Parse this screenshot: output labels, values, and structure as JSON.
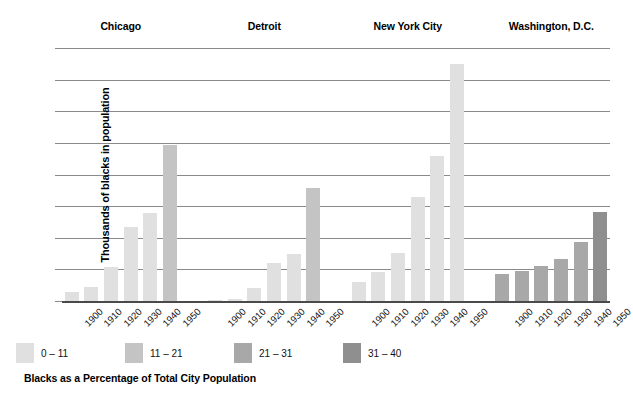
{
  "chart_data": {
    "type": "bar",
    "title": "",
    "xlabel": "",
    "ylabel": "Thousands of blacks in population",
    "ylim": [
      0,
      800
    ],
    "ytick_values": [
      0,
      100,
      200,
      300,
      400,
      500,
      600,
      700,
      800
    ],
    "ytick_labels": [
      "0",
      "100",
      "200",
      "300",
      "400",
      "500",
      "600",
      "700",
      "800"
    ],
    "grid": true,
    "legend_position": "bottom-left",
    "legend_title": "Blacks as a Percentage of Total City Population",
    "categories": [
      "1900",
      "1910",
      "1920",
      "1930",
      "1940",
      "1950"
    ],
    "groups": [
      {
        "name": "Chicago",
        "values": [
          30,
          44,
          109,
          234,
          278,
          492
        ],
        "shades": [
          "0 – 11",
          "0 – 11",
          "0 – 11",
          "0 – 11",
          "0 – 11",
          "11 – 21"
        ]
      },
      {
        "name": "Detroit",
        "values": [
          4,
          6,
          41,
          120,
          149,
          358
        ],
        "shades": [
          "0 – 11",
          "0 – 11",
          "0 – 11",
          "0 – 11",
          "0 – 11",
          "11 – 21"
        ]
      },
      {
        "name": "New York City",
        "values": [
          60,
          92,
          152,
          328,
          458,
          749
        ],
        "shades": [
          "0 – 11",
          "0 – 11",
          "0 – 11",
          "0 – 11",
          "0 – 11",
          "0 – 11"
        ]
      },
      {
        "name": "Washington, D.C.",
        "values": [
          87,
          94,
          110,
          132,
          187,
          280
        ],
        "shades": [
          "21 – 31",
          "21 – 31",
          "21 – 31",
          "21 – 31",
          "21 – 31",
          "31 – 40"
        ]
      }
    ],
    "legend": [
      {
        "label": "0 – 11",
        "color": "#e0e0e0"
      },
      {
        "label": "11 – 21",
        "color": "#c4c4c4"
      },
      {
        "label": "21 – 31",
        "color": "#a8a8a8"
      },
      {
        "label": "31 – 40",
        "color": "#8f8f8f"
      }
    ],
    "colors": {
      "gridline": "#8a8a8a",
      "axis": "#4a4a4a",
      "background": "#ffffff",
      "text": "#000000"
    }
  }
}
